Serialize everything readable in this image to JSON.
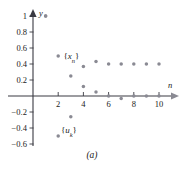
{
  "caption": "(a)",
  "chart_data": {
    "type": "scatter",
    "title": "",
    "subtitle": "",
    "xlabel": "n",
    "ylabel": "y",
    "grid": false,
    "legend_position": "inline-annotation",
    "xlim": [
      0,
      11.5
    ],
    "ylim": [
      -0.72,
      1.12
    ],
    "x_ticks": [
      2,
      4,
      6,
      8,
      10
    ],
    "x_tick_labels": [
      "2",
      "4",
      "6",
      "8",
      "10"
    ],
    "y_ticks": [
      -0.6,
      -0.4,
      -0.2,
      0.2,
      0.4,
      0.6,
      0.8,
      1
    ],
    "y_tick_labels": [
      "-0.6",
      "-0.4",
      "-0.2",
      "0.2",
      "0.4",
      "0.6",
      "0.8",
      "1"
    ],
    "annotations": [
      {
        "text": "{x_n}",
        "base": "x",
        "sub": "n",
        "x": 3.05,
        "y": 0.5
      },
      {
        "text": "{u_k}",
        "base": "u",
        "sub": "k",
        "x": 2.85,
        "y": -0.42
      }
    ],
    "series": [
      {
        "name": "{x_n}",
        "marker": "circle",
        "color": "#8a8a93",
        "x": [
          1,
          2,
          3,
          4,
          5,
          6,
          7,
          8,
          9,
          10
        ],
        "values": [
          1.0,
          0.5,
          0.25,
          0.37,
          0.43,
          0.4,
          0.4,
          0.4,
          0.4,
          0.4
        ]
      },
      {
        "name": "{u_k}",
        "marker": "circle",
        "color": "#8a8a93",
        "x": [
          1,
          2,
          3,
          4,
          5,
          6,
          7,
          8,
          9,
          10
        ],
        "values": [
          1.0,
          -0.5,
          -0.26,
          0.12,
          0.05,
          0.0,
          -0.03,
          0.0,
          0.0,
          0.0
        ]
      }
    ]
  }
}
